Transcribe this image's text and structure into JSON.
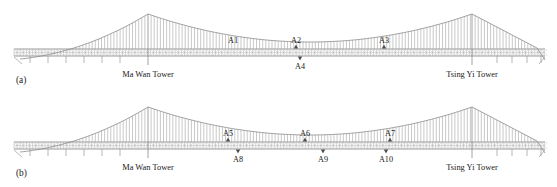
{
  "figure": {
    "colors": {
      "cable": "#8a8a8a",
      "hanger": "#9a9a9a",
      "deck": "#6e6e6e",
      "marker": "#4d4d4d",
      "text": "#1a1a1a",
      "background": "#ffffff"
    },
    "panels": [
      {
        "id": "a",
        "panel_label": "(a)",
        "towers": [
          {
            "name": "Ma Wan Tower",
            "x": 148,
            "apex_y": 14
          },
          {
            "name": "Tsing Yi Tower",
            "x": 472,
            "apex_y": 14
          }
        ],
        "deck_y": 56,
        "sensors": [
          {
            "label": "A1",
            "x": 233,
            "side": "above",
            "has_marker": false
          },
          {
            "label": "A2",
            "x": 296,
            "side": "above",
            "has_marker": true
          },
          {
            "label": "A3",
            "x": 384,
            "side": "above",
            "has_marker": true
          },
          {
            "label": "A4",
            "x": 300,
            "side": "below",
            "has_marker": true
          }
        ]
      },
      {
        "id": "b",
        "panel_label": "(b)",
        "towers": [
          {
            "name": "Ma Wan Tower",
            "x": 148,
            "apex_y": 107
          },
          {
            "name": "Tsing Yi Tower",
            "x": 472,
            "apex_y": 107
          }
        ],
        "deck_y": 149,
        "sensors": [
          {
            "label": "A5",
            "x": 228,
            "side": "above",
            "has_marker": true
          },
          {
            "label": "A6",
            "x": 305,
            "side": "above",
            "has_marker": true
          },
          {
            "label": "A7",
            "x": 390,
            "side": "above",
            "has_marker": true
          },
          {
            "label": "A8",
            "x": 238,
            "side": "below",
            "has_marker": true
          },
          {
            "label": "A9",
            "x": 323,
            "side": "below",
            "has_marker": true
          },
          {
            "label": "A10",
            "x": 386,
            "side": "below",
            "has_marker": true
          }
        ]
      }
    ]
  }
}
